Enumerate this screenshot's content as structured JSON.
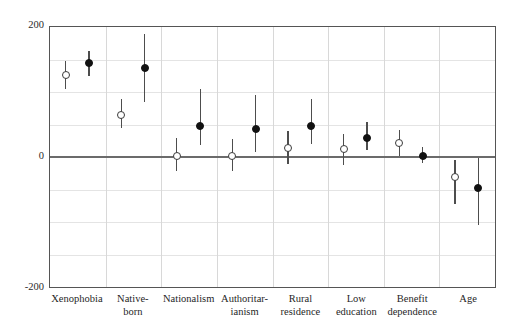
{
  "chart_data": {
    "type": "scatter",
    "title": "",
    "subtitle": "",
    "xlabel": "",
    "ylabel": "",
    "ylim": [
      -200,
      200
    ],
    "yticks": [
      200,
      0,
      -200
    ],
    "ytick_labels": [
      "200",
      "0",
      "-200"
    ],
    "gridlines_y": [
      150,
      100,
      50,
      -50,
      -100,
      -150
    ],
    "grid": true,
    "legend_position": "none",
    "categories": [
      "Xenophobia",
      "Native-\nborn",
      "Nationalism",
      "Authoritar-\nianism",
      "Rural\nresidence",
      "Low\neducation",
      "Benefit\ndependence",
      "Age"
    ],
    "series": [
      {
        "name": "open",
        "marker": "open-circle",
        "values": [
          126,
          65,
          2,
          2,
          14,
          12,
          21,
          -30
        ],
        "ci_low": [
          104,
          45,
          -22,
          -22,
          -10,
          -12,
          2,
          -72
        ],
        "ci_high": [
          148,
          90,
          30,
          28,
          40,
          36,
          42,
          -4
        ]
      },
      {
        "name": "filled",
        "marker": "filled-circle",
        "values": [
          144,
          137,
          48,
          43,
          48,
          30,
          2,
          -48
        ],
        "ci_low": [
          124,
          85,
          18,
          8,
          20,
          10,
          -10,
          -105
        ],
        "ci_high": [
          163,
          190,
          104,
          96,
          90,
          54,
          16,
          -2
        ]
      }
    ]
  },
  "colors": {
    "frame": "#555555",
    "zero_line": "#6b6b6b",
    "grid": "#e4e4e4",
    "panel_divider": "#d8d8d8",
    "open_marker_fill": "#ffffff",
    "open_marker_stroke": "#3a3a3a",
    "filled_marker": "#111111",
    "whisker": "#4d4d4d",
    "text": "#1f1f1f",
    "background": "#ffffff"
  }
}
